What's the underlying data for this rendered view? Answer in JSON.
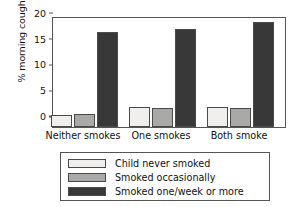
{
  "chart_data": {
    "type": "bar",
    "title": "",
    "xlabel": "",
    "ylabel": "% morning cough",
    "categories": [
      "Neither smokes",
      "One smokes",
      "Both smoke"
    ],
    "yticks": [
      0,
      5,
      10,
      15,
      20
    ],
    "ylim": [
      0,
      21.5
    ],
    "grid": false,
    "legend_position": "below-plot",
    "series": [
      {
        "name": "Child never smoked",
        "color": "#f0efed",
        "values": [
          2.3,
          3.9,
          3.9
        ]
      },
      {
        "name": "Smoked occasionally",
        "color": "#a9a9a7",
        "values": [
          2.6,
          3.7,
          3.7
        ]
      },
      {
        "name": "Smoked one/week or more",
        "color": "#383838",
        "values": [
          18.4,
          18.9,
          20.3
        ]
      }
    ]
  },
  "axis": {
    "frame_color": "#555555"
  }
}
